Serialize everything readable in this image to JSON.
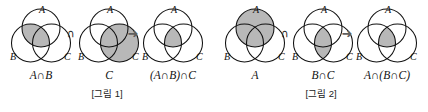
{
  "document": {
    "language": "ko",
    "topic": "set-intersection-associativity-venn-diagrams",
    "background_color": "#ffffff",
    "ink_color": "#111111",
    "shade_color": "#b8b8b8"
  },
  "symbols": {
    "intersection": "∩",
    "arrow": "➜",
    "circle_label_a": "A",
    "circle_label_b": "B",
    "circle_label_c": "C"
  },
  "figure1": {
    "caption": "[그림 1]",
    "operator": "∩",
    "arrow": "➜",
    "panels": [
      {
        "name": "a-inter-b",
        "label": "A∩B",
        "shaded_region": "A∩B",
        "circle_labels": [
          "A",
          "B",
          "C"
        ]
      },
      {
        "name": "c",
        "label": "C",
        "shaded_region": "C",
        "circle_labels": [
          "A",
          "B",
          "C"
        ]
      },
      {
        "name": "a-inter-b-inter-c",
        "label": "(A∩B)∩C",
        "shaded_region": "A∩B∩C",
        "circle_labels": [
          "A",
          "B",
          "C"
        ]
      }
    ]
  },
  "figure2": {
    "caption": "[그림 2]",
    "operator": "∩",
    "arrow": "➜",
    "panels": [
      {
        "name": "a",
        "label": "A",
        "shaded_region": "A",
        "circle_labels": [
          "A",
          "B",
          "C"
        ]
      },
      {
        "name": "b-inter-c",
        "label": "B∩C",
        "shaded_region": "B∩C",
        "circle_labels": [
          "A",
          "B",
          "C"
        ]
      },
      {
        "name": "a-inter-b-inter-c",
        "label": "A∩(B∩C)",
        "shaded_region": "A∩B∩C",
        "circle_labels": [
          "A",
          "B",
          "C"
        ]
      }
    ]
  }
}
